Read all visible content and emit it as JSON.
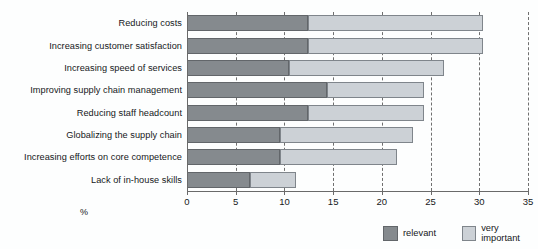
{
  "chart_data": {
    "type": "bar",
    "orientation": "horizontal",
    "stacked": true,
    "title": "",
    "xlabel": "%",
    "ylabel": "",
    "xlim": [
      0,
      35
    ],
    "xticks": [
      0,
      5,
      10,
      15,
      20,
      25,
      30,
      35
    ],
    "grid": "vertical-dashed",
    "legend_position": "bottom-right",
    "categories": [
      "Reducing costs",
      "Increasing customer satisfaction",
      "Increasing speed of services",
      "Improving supply chain management",
      "Reducing staff headcount",
      "Globalizing the supply chain",
      "Increasing efforts on core competence",
      "Lack of in-house skills"
    ],
    "series": [
      {
        "name": "relevant",
        "color": "#858a8e",
        "values": [
          12.4,
          12.4,
          10.5,
          14.4,
          12.4,
          9.5,
          9.5,
          6.5
        ]
      },
      {
        "name": "very important",
        "color": "#ccd1d6",
        "values": [
          18.0,
          18.0,
          15.9,
          9.9,
          11.9,
          13.7,
          12.1,
          4.7
        ]
      }
    ],
    "totals": [
      30.4,
      30.4,
      26.4,
      24.3,
      24.3,
      23.2,
      21.6,
      11.2
    ]
  },
  "axis": {
    "tick_labels": [
      "0",
      "5",
      "10",
      "15",
      "20",
      "25",
      "30",
      "35"
    ],
    "x_title": "%"
  },
  "legend": {
    "items": [
      {
        "label": "relevant",
        "color": "#858a8e"
      },
      {
        "label": "very important",
        "color": "#ccd1d6"
      }
    ]
  },
  "colors": {
    "relevant": "#858a8e",
    "very_important": "#ccd1d6",
    "axis": "#6a6a6a",
    "gridline": "#6f6f6f",
    "text": "#16181a",
    "background": "#fdfefe"
  }
}
